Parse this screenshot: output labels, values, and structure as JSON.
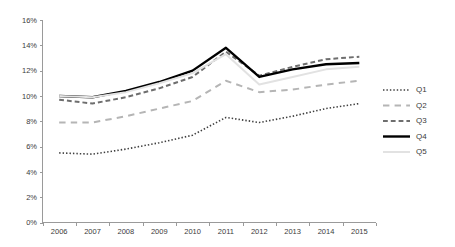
{
  "chart_data": {
    "type": "line",
    "title": "",
    "xlabel": "",
    "ylabel": "",
    "categories": [
      "2006",
      "2007",
      "2008",
      "2009",
      "2010",
      "2011",
      "2012",
      "2013",
      "2014",
      "2015"
    ],
    "x_tick_labels": [
      "2006",
      "2007",
      "2008",
      "2009",
      "2010",
      "2011",
      "2012",
      "2013",
      "2014",
      "2015"
    ],
    "y_tick_labels": [
      "0%",
      "2%",
      "4%",
      "6%",
      "8%",
      "10%",
      "12%",
      "14%",
      "16%"
    ],
    "y_tick_values": [
      0,
      2,
      4,
      6,
      8,
      10,
      12,
      14,
      16
    ],
    "ylim": [
      0,
      16
    ],
    "grid": false,
    "legend_position": "right",
    "series": [
      {
        "name": "Q1",
        "style": "dotted",
        "color": "#3f3f3f",
        "width": 1.6,
        "values": [
          5.5,
          5.4,
          5.8,
          6.3,
          6.9,
          8.3,
          7.9,
          8.4,
          9.0,
          9.4
        ]
      },
      {
        "name": "Q2",
        "style": "long-dash",
        "color": "#b5b5b5",
        "width": 2.0,
        "values": [
          7.9,
          7.9,
          8.4,
          9.0,
          9.6,
          11.2,
          10.3,
          10.5,
          10.9,
          11.2
        ]
      },
      {
        "name": "Q3",
        "style": "dash",
        "color": "#6e6e6e",
        "width": 2.0,
        "values": [
          9.7,
          9.4,
          9.9,
          10.6,
          11.5,
          13.5,
          11.6,
          12.3,
          12.9,
          13.1
        ]
      },
      {
        "name": "Q4",
        "style": "solid",
        "color": "#000000",
        "width": 2.4,
        "values": [
          10.0,
          9.9,
          10.4,
          11.1,
          12.0,
          13.8,
          11.5,
          12.1,
          12.5,
          12.6
        ]
      },
      {
        "name": "Q5",
        "style": "solid",
        "color": "#e2e2e2",
        "width": 2.0,
        "values": [
          10.0,
          9.9,
          10.3,
          11.0,
          11.8,
          13.3,
          10.9,
          11.5,
          12.1,
          12.3
        ]
      }
    ]
  },
  "legend": {
    "items": [
      {
        "label": "Q1"
      },
      {
        "label": "Q2"
      },
      {
        "label": "Q3"
      },
      {
        "label": "Q4"
      },
      {
        "label": "Q5"
      }
    ]
  },
  "colors": {
    "axis": "#9a9a9a",
    "text": "#3b3b3b",
    "background": "#ffffff"
  }
}
